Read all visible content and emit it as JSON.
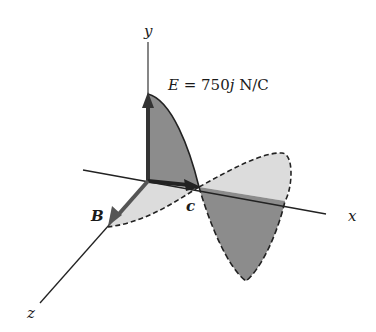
{
  "figure": {
    "type": "electromagnetic-wave-3d",
    "axes": {
      "x_label": "x",
      "y_label": "y",
      "z_label": "z"
    },
    "vectors": {
      "electric_field_label": "E",
      "electric_field_equation": "E = 750j N/C",
      "equation_lhs": "E",
      "equation_eq": " = ",
      "equation_value": "750",
      "equation_unit_vector": "j",
      "equation_units": " N/C",
      "magnetic_field_label": "B",
      "velocity_label": "c"
    },
    "colors": {
      "e_wave_fill": "#8c8c8c",
      "b_wave_fill": "#dcdcdc",
      "vector_color": "#333333",
      "axis_color": "#222222",
      "outline": "#222222"
    }
  }
}
